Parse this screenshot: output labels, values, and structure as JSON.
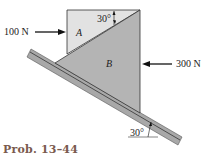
{
  "figure": {
    "caption": "Prob. 13–44",
    "block_a_label": "A",
    "block_b_label": "B",
    "force_left": "100 N",
    "force_right": "300 N",
    "angle_top": "30°",
    "angle_bottom": "30°"
  },
  "colors": {
    "block_a": "#e2e2e2",
    "block_b": "#b4b4b4",
    "incline": "#a8a8a8",
    "caption": "#7a5a4e"
  }
}
